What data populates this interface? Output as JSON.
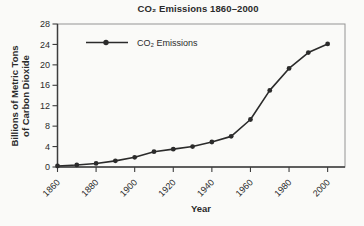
{
  "figure": {
    "background": "#fafaf8",
    "ink_color": "#2b2b2b",
    "title": "CO₂ Emissions 1860–2000",
    "xlabel": "Year",
    "ylabel_line1": "Billions of Metric Tons",
    "ylabel_line2": "of Carbon Dioxide",
    "legend_label": "CO₂ Emissions"
  },
  "chart_data": {
    "type": "line",
    "title": "CO₂ Emissions 1860–2000",
    "xlabel": "Year",
    "ylabel": "Billions of Metric Tons of Carbon Dioxide",
    "legend": [
      "CO₂ Emissions"
    ],
    "legend_position": "upper-left-inside",
    "x": [
      1860,
      1870,
      1880,
      1890,
      1900,
      1910,
      1920,
      1930,
      1940,
      1950,
      1960,
      1970,
      1980,
      1990,
      2000
    ],
    "values": [
      0.2,
      0.4,
      0.7,
      1.2,
      1.9,
      3.0,
      3.5,
      4.0,
      4.9,
      6.0,
      9.3,
      15.0,
      19.3,
      22.4,
      24.1
    ],
    "xlim": [
      1860,
      2009
    ],
    "ylim": [
      0,
      28
    ],
    "x_ticks": [
      1860,
      1880,
      1900,
      1920,
      1940,
      1960,
      1980,
      2000
    ],
    "y_ticks": [
      0,
      4,
      8,
      12,
      16,
      20,
      24,
      28
    ],
    "grid": false,
    "marker": "circle",
    "line_color": "#2b2b2b",
    "axis_color": "#3d3d3d",
    "frame_color": "#949494"
  }
}
